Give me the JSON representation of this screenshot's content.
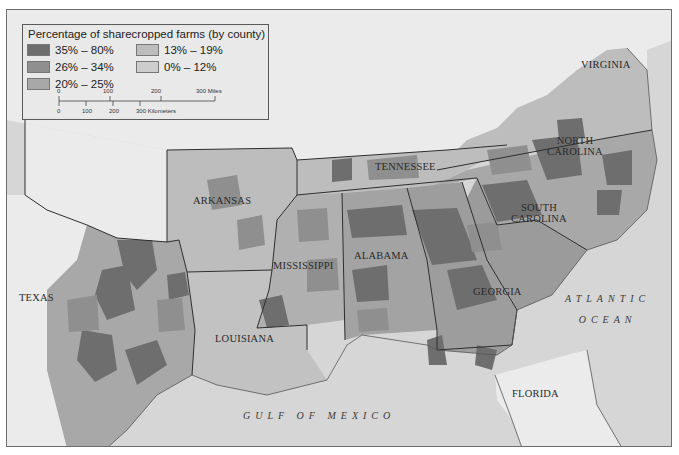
{
  "legend": {
    "title": "Percentage of sharecropped farms (by county)",
    "classes": [
      {
        "label": "35% – 80%",
        "color": "#6e6e6e"
      },
      {
        "label": "26% – 34%",
        "color": "#8f8f8f"
      },
      {
        "label": "20% – 25%",
        "color": "#a8a8a8"
      },
      {
        "label": "13% – 19%",
        "color": "#bdbdbd"
      },
      {
        "label": "0% – 12%",
        "color": "#cdcdcd"
      }
    ],
    "scale": {
      "miles": {
        "ticks": [
          "0",
          "100",
          "200"
        ],
        "end": "300 Miles"
      },
      "kilometers": {
        "ticks": [
          "0",
          "100",
          "200"
        ],
        "end": "300 Kilometers"
      }
    }
  },
  "states": [
    {
      "name": "VIRGINIA"
    },
    {
      "name": "NORTH",
      "name2": "CAROLINA"
    },
    {
      "name": "TENNESSEE"
    },
    {
      "name": "ARKANSAS"
    },
    {
      "name": "SOUTH",
      "name2": "CAROLINA"
    },
    {
      "name": "MISSISSIPPI"
    },
    {
      "name": "ALABAMA"
    },
    {
      "name": "TEXAS"
    },
    {
      "name": "GEORGIA"
    },
    {
      "name": "LOUISIANA"
    },
    {
      "name": "FLORIDA"
    }
  ],
  "water_bodies": [
    {
      "name": "ATLANTIC",
      "name2": "OCEAN"
    },
    {
      "name": "GULF OF MEXICO"
    }
  ],
  "colors": {
    "water": "#d6d6d6",
    "nonsurvey_land": "#ebebeb",
    "border": "#2e2e2e"
  }
}
